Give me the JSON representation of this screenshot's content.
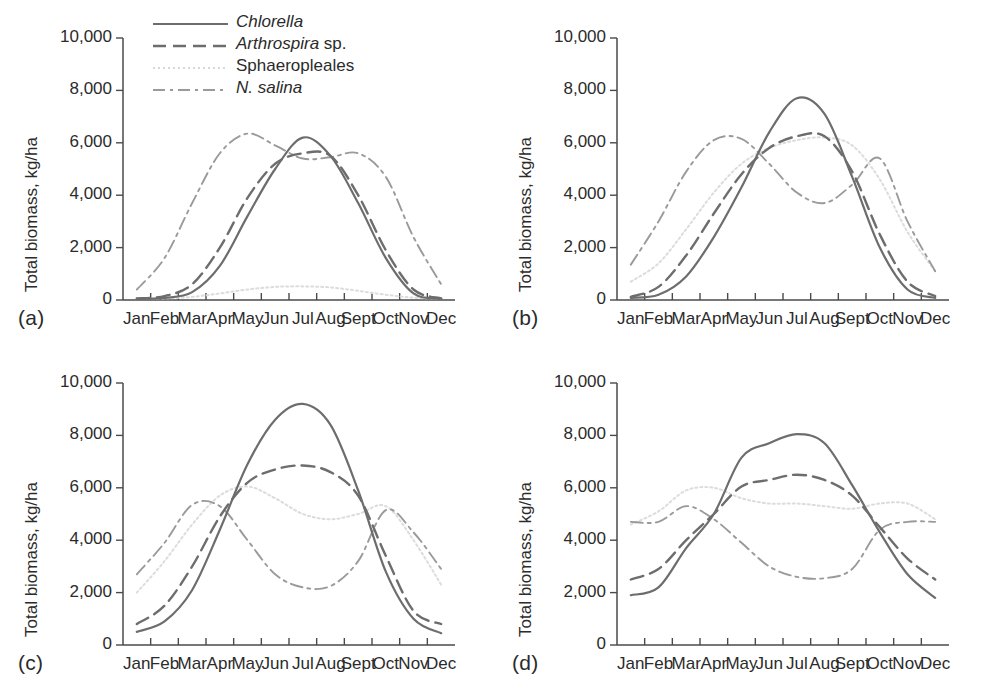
{
  "figure": {
    "panels": [
      "(a)",
      "(b)",
      "(c)",
      "(d)"
    ],
    "axis_label_y": "Total biomass, kg/ha",
    "y_ticks": [
      "0",
      "2,000",
      "4,000",
      "6,000",
      "8,000",
      "10,000"
    ],
    "x_ticks": [
      "Jan",
      "Feb",
      "Mar",
      "Apr",
      "May",
      "Jun",
      "Jul",
      "Aug",
      "Sept",
      "Oct",
      "Nov",
      "Dec"
    ],
    "legend": [
      {
        "label_italic": "Chlorella",
        "label_rest": "",
        "style": "solid",
        "color": "#6d6d6d"
      },
      {
        "label_italic": "Arthrospira",
        "label_rest": " sp.",
        "style": "dashed",
        "color": "#6d6d6d"
      },
      {
        "label_italic": "",
        "label_rest": "Sphaeropleales",
        "style": "dotted",
        "color": "#d8d8d8"
      },
      {
        "label_italic": "N. salina",
        "label_rest": "",
        "style": "dashdot",
        "color": "#9a9a9a"
      }
    ]
  },
  "colors": {
    "axis": "#4a4a4a",
    "chlorella": "#6d6d6d",
    "arthrospira": "#6d6d6d",
    "sphaeropleales": "#dcdcdc",
    "nsalina": "#9a9a9a",
    "text": "#2b2b2b",
    "background": "#ffffff"
  },
  "chart_data": [
    {
      "type": "line",
      "panel": "(a)",
      "title": "",
      "xlabel": "",
      "ylabel": "Total biomass, kg/ha",
      "categories": [
        "Jan",
        "Feb",
        "Mar",
        "Apr",
        "May",
        "Jun",
        "Jul",
        "Aug",
        "Sept",
        "Oct",
        "Nov",
        "Dec"
      ],
      "ylim": [
        0,
        10000
      ],
      "xlim": [
        "Jan",
        "Dec"
      ],
      "grid": false,
      "legend_position": "top-left",
      "series": [
        {
          "name": "Chlorella",
          "style": "solid",
          "values": [
            40,
            80,
            300,
            1300,
            3200,
            5000,
            6200,
            5500,
            3700,
            1600,
            250,
            40
          ]
        },
        {
          "name": "Arthrospira sp.",
          "style": "dashed",
          "values": [
            60,
            150,
            600,
            2000,
            3900,
            5200,
            5600,
            5500,
            4000,
            1900,
            400,
            60
          ]
        },
        {
          "name": "Sphaeropleales",
          "style": "dotted",
          "values": [
            40,
            60,
            120,
            250,
            400,
            500,
            520,
            480,
            350,
            200,
            90,
            40
          ]
        },
        {
          "name": "N. salina",
          "style": "dashdot",
          "values": [
            400,
            1600,
            3700,
            5600,
            6350,
            5900,
            5400,
            5450,
            5600,
            4700,
            2400,
            600
          ]
        }
      ]
    },
    {
      "type": "line",
      "panel": "(b)",
      "title": "",
      "xlabel": "",
      "ylabel": "Total biomass, kg/ha",
      "categories": [
        "Jan",
        "Feb",
        "Mar",
        "Apr",
        "May",
        "Jun",
        "Jul",
        "Aug",
        "Sept",
        "Oct",
        "Nov",
        "Dec"
      ],
      "ylim": [
        0,
        10000
      ],
      "grid": false,
      "legend_position": "none",
      "series": [
        {
          "name": "Chlorella",
          "style": "solid",
          "values": [
            80,
            200,
            900,
            2400,
            4300,
            6400,
            7700,
            7100,
            4700,
            2000,
            400,
            80
          ]
        },
        {
          "name": "Arthrospira sp.",
          "style": "dashed",
          "values": [
            120,
            500,
            1700,
            3300,
            4800,
            5800,
            6250,
            6250,
            4900,
            2500,
            700,
            150
          ]
        },
        {
          "name": "Sphaeropleales",
          "style": "dotted",
          "values": [
            700,
            1400,
            2700,
            4100,
            5200,
            5800,
            6100,
            6200,
            5900,
            4600,
            2600,
            1100
          ]
        },
        {
          "name": "N. salina",
          "style": "dashdot",
          "values": [
            1350,
            3000,
            4900,
            6100,
            6150,
            5200,
            4100,
            3700,
            4400,
            5400,
            3000,
            1100
          ]
        }
      ]
    },
    {
      "type": "line",
      "panel": "(c)",
      "title": "",
      "xlabel": "",
      "ylabel": "Total biomass, kg/ha",
      "categories": [
        "Jan",
        "Feb",
        "Mar",
        "Apr",
        "May",
        "Jun",
        "Jul",
        "Aug",
        "Sept",
        "Oct",
        "Nov",
        "Dec"
      ],
      "ylim": [
        0,
        10000
      ],
      "grid": false,
      "legend_position": "none",
      "series": [
        {
          "name": "Chlorella",
          "style": "solid",
          "values": [
            500,
            900,
            2100,
            4400,
            6900,
            8600,
            9200,
            8400,
            5900,
            2800,
            1000,
            450
          ]
        },
        {
          "name": "Arthrospira sp.",
          "style": "dashed",
          "values": [
            800,
            1500,
            3000,
            4900,
            6200,
            6700,
            6850,
            6600,
            5700,
            3400,
            1300,
            800
          ]
        },
        {
          "name": "Sphaeropleales",
          "style": "dotted",
          "values": [
            2000,
            3200,
            4600,
            5700,
            6050,
            5600,
            5000,
            4800,
            5000,
            5300,
            4000,
            2300
          ]
        },
        {
          "name": "N. salina",
          "style": "dashdot",
          "values": [
            2700,
            3900,
            5350,
            5300,
            4000,
            2700,
            2200,
            2250,
            3200,
            5150,
            4300,
            2900
          ]
        }
      ]
    },
    {
      "type": "line",
      "panel": "(d)",
      "title": "",
      "xlabel": "",
      "ylabel": "Total biomass, kg/ha",
      "categories": [
        "Jan",
        "Feb",
        "Mar",
        "Apr",
        "May",
        "Jun",
        "Jul",
        "Aug",
        "Sept",
        "Oct",
        "Nov",
        "Dec"
      ],
      "ylim": [
        0,
        10000
      ],
      "grid": false,
      "legend_position": "none",
      "series": [
        {
          "name": "Chlorella",
          "style": "solid",
          "values": [
            1900,
            2200,
            3700,
            5000,
            7150,
            7700,
            8050,
            7700,
            6100,
            4300,
            2700,
            1800
          ]
        },
        {
          "name": "Arthrospira sp.",
          "style": "dashed",
          "values": [
            2500,
            2900,
            4000,
            5000,
            6050,
            6300,
            6500,
            6300,
            5700,
            4500,
            3300,
            2500
          ]
        },
        {
          "name": "Sphaeropleales",
          "style": "dotted",
          "values": [
            4600,
            5100,
            5900,
            6000,
            5600,
            5400,
            5400,
            5300,
            5200,
            5400,
            5400,
            4800
          ]
        },
        {
          "name": "N. salina",
          "style": "dashdot",
          "values": [
            4700,
            4700,
            5300,
            4800,
            3900,
            3000,
            2600,
            2550,
            2900,
            4400,
            4700,
            4700
          ]
        }
      ]
    }
  ]
}
